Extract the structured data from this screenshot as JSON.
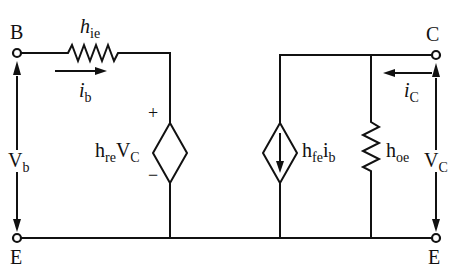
{
  "diagram": {
    "type": "h-parameter small-signal transistor model",
    "terminals": {
      "base": "B",
      "collector": "C",
      "emitter_left": "E",
      "emitter_right": "E"
    },
    "components": {
      "input_resistor": {
        "symbol": "h",
        "subscript": "ie"
      },
      "input_source": {
        "symbol_a": "h",
        "sub_a": "re",
        "symbol_b": "V",
        "sub_b": "C",
        "plus": "+",
        "minus": "−"
      },
      "output_source": {
        "symbol_a": "h",
        "sub_a": "fe",
        "symbol_b": "i",
        "sub_b": "b"
      },
      "output_conductance": {
        "symbol": "h",
        "subscript": "oe"
      }
    },
    "currents": {
      "base_current": {
        "symbol": "i",
        "subscript": "b"
      },
      "collector_current": {
        "symbol": "i",
        "subscript": "C"
      }
    },
    "voltages": {
      "input_voltage": {
        "symbol": "V",
        "subscript": "b"
      },
      "output_voltage": {
        "symbol": "V",
        "subscript": "C"
      }
    },
    "colors": {
      "stroke": "#111111",
      "background": "#ffffff"
    }
  }
}
